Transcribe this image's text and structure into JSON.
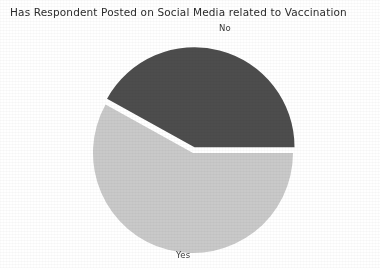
{
  "chart_data": {
    "type": "pie",
    "title": "Has Respondent Posted on Social Media related to Vaccination",
    "categories": [
      "No",
      "Yes"
    ],
    "values": [
      42,
      58
    ],
    "labels": [
      "No",
      "Yes"
    ],
    "colors": [
      "#4d4d4d",
      "#c9c9c9"
    ],
    "explode": [
      0.06,
      0
    ],
    "startangle": 0,
    "counterclock": true,
    "legend": "none",
    "grid": false,
    "xlabel": "",
    "ylabel": "",
    "slices": [
      {
        "label": "No",
        "value": 42,
        "percent": 42,
        "color": "#4d4d4d",
        "start_angle_deg": 0,
        "end_angle_deg": 151,
        "exploded": true
      },
      {
        "label": "Yes",
        "value": 58,
        "percent": 58,
        "color": "#c9c9c9",
        "start_angle_deg": 151,
        "end_angle_deg": 360,
        "exploded": false
      }
    ]
  },
  "figure": {
    "background": "#ffffff",
    "title": "Has Respondent Posted on Social Media related to Vaccination",
    "label_no": "No",
    "label_yes": "Yes"
  }
}
